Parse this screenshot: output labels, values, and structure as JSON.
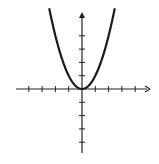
{
  "chart_data": {
    "type": "line",
    "title": "",
    "xlabel": "",
    "ylabel": "",
    "function": "y = x^2",
    "series": [
      {
        "name": "parabola",
        "x": [
          -2.45,
          -2,
          -1.5,
          -1,
          -0.5,
          0,
          0.5,
          1,
          1.5,
          2,
          2.45
        ],
        "values": [
          6.0,
          4,
          2.25,
          1,
          0.25,
          0,
          0.25,
          1,
          2.25,
          4,
          6.0
        ]
      }
    ],
    "xlim": [
      -5,
      5
    ],
    "ylim": [
      -5,
      6
    ],
    "x_ticks": [
      -4,
      -3,
      -2,
      -1,
      1,
      2,
      3,
      4
    ],
    "y_ticks": [
      -4,
      -3,
      -2,
      -1,
      1,
      2,
      3,
      4
    ],
    "tick_labels_shown": false,
    "grid": false,
    "legend": null,
    "axes": {
      "x_arrow": "right",
      "y_arrow": "up"
    },
    "colors": {
      "curve": "#1a1a1a",
      "axes": "#222222",
      "background": "#ffffff"
    }
  },
  "layout": {
    "origin_px": [
      82,
      89
    ],
    "unit_px": 13.3,
    "x_axis_px": [
      16,
      150
    ],
    "y_axis_px": [
      12,
      153
    ]
  }
}
